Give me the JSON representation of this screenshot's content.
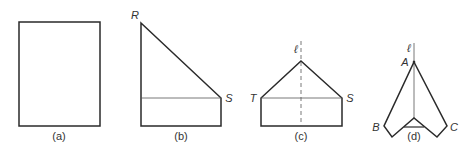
{
  "figure": {
    "panels": [
      {
        "id": "a",
        "caption": "(a)",
        "points": []
      },
      {
        "id": "b",
        "caption": "(b)",
        "points": [
          "R",
          "S"
        ]
      },
      {
        "id": "c",
        "caption": "(c)",
        "points": [
          "T",
          "S"
        ],
        "axis_label": "ℓ"
      },
      {
        "id": "d",
        "caption": "(d)",
        "points": [
          "A",
          "B",
          "C"
        ],
        "axis_label": "ℓ"
      }
    ],
    "colors": {
      "stroke": "#2a2a2a",
      "thin": "#555555",
      "background": "#ffffff"
    }
  }
}
